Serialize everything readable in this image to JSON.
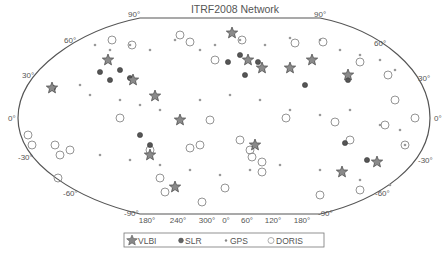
{
  "chart_data": {
    "type": "scatter",
    "title": "ITRF2008 Network",
    "projection": "Hammer/Aitoff-like world map (pseudo-cylindrical, flat poles)",
    "xlabel": "",
    "ylabel": "",
    "x_tick_labels": [
      "180°",
      "240°",
      "300°",
      "0°",
      "60°",
      "120°",
      "180°"
    ],
    "y_tick_labels_left": [
      "90°",
      "60°",
      "30°",
      "0°",
      "-30°",
      "-60°",
      "-90°"
    ],
    "y_tick_labels_right": [
      "90°",
      "60°",
      "30°",
      "0°",
      "-30°",
      "-60°",
      "-90°"
    ],
    "legend": {
      "position": "bottom",
      "entries": [
        {
          "name": "VLBI",
          "marker": "star"
        },
        {
          "name": "SLR",
          "marker": "filled-circle"
        },
        {
          "name": "GPS",
          "marker": "dot"
        },
        {
          "name": "DORIS",
          "marker": "open-circle"
        }
      ]
    },
    "grid": false,
    "series": [
      {
        "name": "VLBI",
        "points_px": [
          [
            52,
            88
          ],
          [
            108,
            60
          ],
          [
            133,
            80
          ],
          [
            232,
            33
          ],
          [
            248,
            60
          ],
          [
            262,
            68
          ],
          [
            290,
            68
          ],
          [
            312,
            60
          ],
          [
            155,
            96
          ],
          [
            180,
            120
          ],
          [
            150,
            155
          ],
          [
            175,
            187
          ],
          [
            255,
            145
          ],
          [
            348,
            75
          ],
          [
            342,
            172
          ],
          [
            377,
            162
          ]
        ]
      },
      {
        "name": "SLR",
        "points_px": [
          [
            100,
            72
          ],
          [
            110,
            80
          ],
          [
            120,
            70
          ],
          [
            130,
            78
          ],
          [
            228,
            62
          ],
          [
            240,
            55
          ],
          [
            245,
            75
          ],
          [
            258,
            62
          ],
          [
            305,
            85
          ],
          [
            348,
            80
          ],
          [
            140,
            135
          ],
          [
            150,
            145
          ],
          [
            345,
            143
          ],
          [
            367,
            160
          ],
          [
            53,
            88
          ]
        ]
      },
      {
        "name": "GPS",
        "points_px": [
          [
            95,
            45
          ],
          [
            110,
            50
          ],
          [
            130,
            45
          ],
          [
            150,
            50
          ],
          [
            175,
            40
          ],
          [
            200,
            50
          ],
          [
            215,
            45
          ],
          [
            240,
            40
          ],
          [
            265,
            45
          ],
          [
            290,
            38
          ],
          [
            320,
            40
          ],
          [
            340,
            50
          ],
          [
            360,
            55
          ],
          [
            380,
            60
          ],
          [
            395,
            70
          ],
          [
            80,
            85
          ],
          [
            90,
            95
          ],
          [
            120,
            100
          ],
          [
            140,
            105
          ],
          [
            160,
            110
          ],
          [
            200,
            100
          ],
          [
            230,
            95
          ],
          [
            260,
            100
          ],
          [
            290,
            110
          ],
          [
            320,
            115
          ],
          [
            350,
            110
          ],
          [
            380,
            125
          ],
          [
            400,
            130
          ],
          [
            405,
            145
          ],
          [
            100,
            155
          ],
          [
            130,
            160
          ],
          [
            160,
            165
          ],
          [
            190,
            170
          ],
          [
            220,
            175
          ],
          [
            250,
            170
          ],
          [
            280,
            165
          ],
          [
            320,
            170
          ],
          [
            360,
            180
          ],
          [
            390,
            185
          ]
        ]
      },
      {
        "name": "DORIS",
        "points_px": [
          [
            28,
            135
          ],
          [
            32,
            145
          ],
          [
            55,
            145
          ],
          [
            60,
            155
          ],
          [
            70,
            150
          ],
          [
            112,
            40
          ],
          [
            132,
            45
          ],
          [
            180,
            35
          ],
          [
            190,
            42
          ],
          [
            215,
            60
          ],
          [
            242,
            40
          ],
          [
            295,
            43
          ],
          [
            323,
            42
          ],
          [
            360,
            62
          ],
          [
            388,
            75
          ],
          [
            395,
            100
          ],
          [
            120,
            118
          ],
          [
            150,
            150
          ],
          [
            190,
            148
          ],
          [
            200,
            145
          ],
          [
            210,
            120
          ],
          [
            240,
            140
          ],
          [
            250,
            150
          ],
          [
            262,
            162
          ],
          [
            262,
            172
          ],
          [
            286,
            118
          ],
          [
            335,
            122
          ],
          [
            350,
            140
          ],
          [
            385,
            125
          ],
          [
            415,
            118
          ],
          [
            405,
            145
          ],
          [
            58,
            178
          ],
          [
            160,
            178
          ],
          [
            165,
            192
          ],
          [
            202,
            202
          ],
          [
            225,
            188
          ],
          [
            252,
            157
          ],
          [
            320,
            195
          ],
          [
            360,
            190
          ]
        ]
      }
    ]
  },
  "title": "ITRF2008 Network",
  "axes": {
    "top_left": "90°",
    "top_right": "90°",
    "left": [
      "60°",
      "30°",
      "0°",
      "-30°",
      "-60°"
    ],
    "right": [
      "60°",
      "30°",
      "0°",
      "-30°",
      "-60°"
    ],
    "bottom_left": "-90°",
    "bottom_right": "-90°",
    "bottom_ticks": [
      "180°",
      "240°",
      "300°",
      "0°",
      "60°",
      "120°",
      "180°"
    ]
  },
  "legend": {
    "vlbi": "VLBI",
    "slr": "SLR",
    "gps": "GPS",
    "doris": "DORIS"
  },
  "colors": {
    "outline": "#555555",
    "marker": "#666666",
    "marker_dark": "#444444",
    "text": "#555555",
    "background": "#ffffff"
  }
}
